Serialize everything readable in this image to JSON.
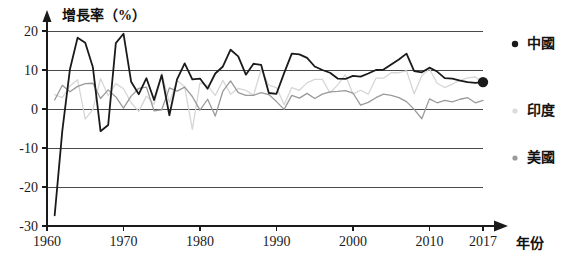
{
  "chart_data": {
    "type": "line",
    "title": "增長率（%）",
    "xlabel": "年份",
    "ylabel": "增長率（%）",
    "xlim": [
      1960,
      2017
    ],
    "ylim": [
      -30,
      20
    ],
    "grid": true,
    "legend_position": "right",
    "x_ticks": [
      "1960",
      "1970",
      "1980",
      "1990",
      "2000",
      "2010",
      "2017"
    ],
    "x_tick_values": [
      1960,
      1970,
      1980,
      1990,
      2000,
      2010,
      2017
    ],
    "y_ticks": [
      "20",
      "10",
      "0",
      "-10",
      "-20",
      "-30"
    ],
    "y_tick_values": [
      20,
      10,
      0,
      -10,
      -20,
      -30
    ],
    "x": [
      1961,
      1962,
      1963,
      1964,
      1965,
      1966,
      1967,
      1968,
      1969,
      1970,
      1971,
      1972,
      1973,
      1974,
      1975,
      1976,
      1977,
      1978,
      1979,
      1980,
      1981,
      1982,
      1983,
      1984,
      1985,
      1986,
      1987,
      1988,
      1989,
      1990,
      1991,
      1992,
      1993,
      1994,
      1995,
      1996,
      1997,
      1998,
      1999,
      2000,
      2001,
      2002,
      2003,
      2004,
      2005,
      2006,
      2007,
      2008,
      2009,
      2010,
      2011,
      2012,
      2013,
      2014,
      2015,
      2016,
      2017
    ],
    "series": [
      {
        "name": "中國",
        "color": "#1a1a1a",
        "marker_end": true,
        "end_value": 6.9,
        "values": [
          -27.3,
          -5.6,
          10.2,
          18.3,
          17.0,
          10.7,
          -5.7,
          -4.1,
          16.9,
          19.3,
          7.0,
          3.8,
          7.9,
          2.3,
          8.7,
          -1.6,
          7.6,
          11.7,
          7.6,
          7.8,
          5.2,
          9.1,
          10.9,
          15.2,
          13.5,
          8.8,
          11.6,
          11.3,
          4.1,
          3.9,
          9.2,
          14.2,
          14.0,
          13.1,
          10.9,
          10.0,
          9.3,
          7.8,
          7.7,
          8.5,
          8.3,
          9.1,
          10.0,
          10.1,
          11.4,
          12.7,
          14.2,
          9.7,
          9.4,
          10.6,
          9.6,
          7.9,
          7.8,
          7.3,
          6.9,
          6.7,
          6.9
        ]
      },
      {
        "name": "印度",
        "color": "#d6d6d6",
        "marker_end": false,
        "end_value": 6.7,
        "values": [
          3.7,
          2.9,
          5.9,
          7.5,
          -2.6,
          -0.1,
          7.8,
          3.4,
          6.5,
          5.2,
          1.6,
          -0.6,
          3.3,
          1.2,
          9.2,
          1.7,
          7.3,
          5.7,
          -5.2,
          6.7,
          6.0,
          3.5,
          7.3,
          3.8,
          5.3,
          4.8,
          3.5,
          10.2,
          6.1,
          5.5,
          1.1,
          5.5,
          4.8,
          6.7,
          7.6,
          7.6,
          4.1,
          6.2,
          8.8,
          3.8,
          4.8,
          3.8,
          7.9,
          7.9,
          9.3,
          9.3,
          9.8,
          3.9,
          8.5,
          10.3,
          6.6,
          5.5,
          6.4,
          7.4,
          8.0,
          8.2,
          6.7
        ]
      },
      {
        "name": "美國",
        "color": "#9a9a9a",
        "marker_end": false,
        "end_value": 2.2,
        "values": [
          2.3,
          6.1,
          4.4,
          5.8,
          6.5,
          6.6,
          2.7,
          4.9,
          3.1,
          0.2,
          3.3,
          5.3,
          5.6,
          -0.5,
          -0.2,
          5.4,
          4.6,
          5.6,
          3.2,
          -0.3,
          2.5,
          -1.8,
          4.6,
          7.2,
          4.2,
          3.5,
          3.5,
          4.2,
          3.7,
          1.9,
          -0.1,
          3.5,
          2.8,
          4.0,
          2.7,
          3.8,
          4.4,
          4.5,
          4.7,
          4.1,
          1.0,
          1.7,
          2.9,
          3.8,
          3.5,
          2.9,
          1.9,
          -0.1,
          -2.5,
          2.6,
          1.6,
          2.2,
          1.8,
          2.5,
          2.9,
          1.6,
          2.2
        ]
      }
    ],
    "legend": [
      {
        "label": "中國",
        "color": "#1a1a1a"
      },
      {
        "label": "印度",
        "color": "#dcdcdc"
      },
      {
        "label": "美國",
        "color": "#9a9a9a"
      }
    ]
  }
}
